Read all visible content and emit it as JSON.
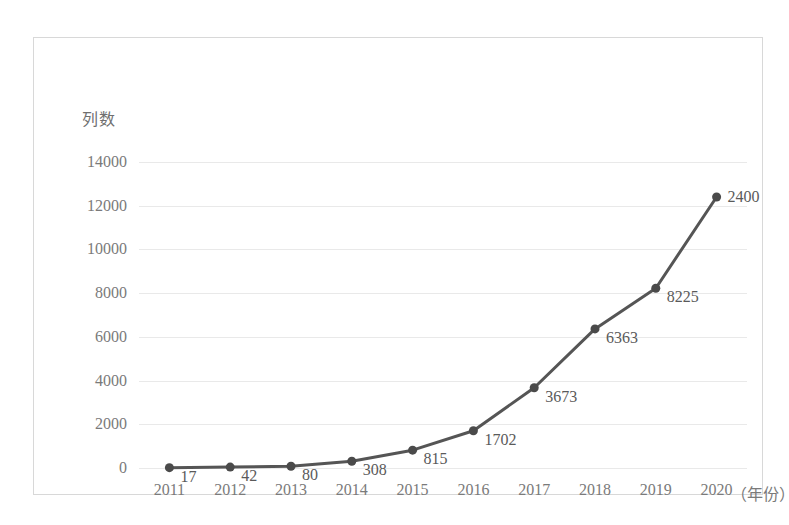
{
  "chart_data": {
    "type": "line",
    "title": "",
    "subtitle": "",
    "xlabel": "（年份）",
    "ylabel": "列数",
    "categories": [
      "2011",
      "2012",
      "2013",
      "2014",
      "2015",
      "2016",
      "2017",
      "2018",
      "2019",
      "2020"
    ],
    "values": [
      17,
      42,
      80,
      308,
      815,
      1702,
      3673,
      6363,
      8225,
      12400
    ],
    "point_labels": [
      "17",
      "42",
      "80",
      "308",
      "815",
      "1702",
      "3673",
      "6363",
      "8225",
      "2400"
    ],
    "ylim": [
      0,
      14000
    ],
    "y_ticks": [
      0,
      2000,
      4000,
      6000,
      8000,
      10000,
      12000,
      14000
    ],
    "y_tick_labels": [
      "0",
      "2000",
      "4000",
      "6000",
      "8000",
      "10000",
      "12000",
      "14000"
    ],
    "grid": true,
    "legend": "none",
    "series": [
      {
        "name": "列数",
        "values": [
          17,
          42,
          80,
          308,
          815,
          1702,
          3673,
          6363,
          8225,
          12400
        ]
      }
    ],
    "colors": {
      "line": "#555555",
      "marker": "#4a4a4a",
      "gridline": "#e9e9e9",
      "tick_text": "#7a7a7a",
      "label_text": "#5a5a5a",
      "frame": "#d8d8d8",
      "background": "#ffffff"
    },
    "marker_style": "circle",
    "line_width": 3
  }
}
